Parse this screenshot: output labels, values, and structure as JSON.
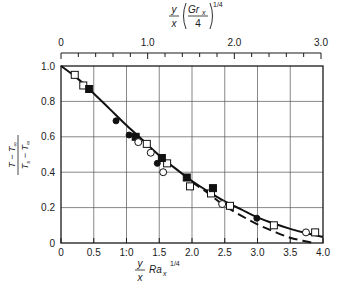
{
  "chart_data": {
    "type": "scatter",
    "title": "",
    "xlabel": "y/x Ra_x^(1/4)",
    "xlabel_parts": {
      "frac_num": "y",
      "frac_den": "x",
      "main": "Ra",
      "sub": "x",
      "sup": "1/4"
    },
    "top_xlabel": "y/x (Gr_x/4)^(1/4)",
    "top_xlabel_parts": {
      "frac_num": "y",
      "frac_den": "x",
      "inner_num": "Gr",
      "inner_sub": "x",
      "inner_den": "4",
      "sup": "1/4"
    },
    "ylabel": "(T − T∞)/(Ts − T∞)",
    "ylabel_parts": {
      "num": "T − T",
      "num_sub": "∞",
      "den": "T",
      "den_sub1": "s",
      "den_mid": " − T",
      "den_sub2": "∞"
    },
    "xlim": [
      0,
      4.0
    ],
    "ylim": [
      0,
      1.0
    ],
    "top_xlim": [
      0,
      3.0
    ],
    "grid": true,
    "x_ticks": [
      0,
      0.5,
      1.0,
      1.5,
      2.0,
      2.5,
      3.0,
      3.5,
      4.0
    ],
    "x_tick_labels": [
      "0",
      "0.5",
      "1:0",
      "1.5",
      "2.0",
      "2.5",
      "3.0",
      "3.5",
      "4.0"
    ],
    "y_ticks": [
      0,
      0.2,
      0.4,
      0.6,
      0.8,
      1.0
    ],
    "y_tick_labels": [
      "0",
      "0.2",
      "0.4",
      "0.6",
      "0.8",
      "1.0"
    ],
    "top_x_major_ticks": [
      0,
      1.0,
      2.0,
      3.0
    ],
    "top_x_tick_labels": [
      "0",
      "1.0",
      "2.0",
      "3.0"
    ],
    "top_x_minor_step": 0.2,
    "legend": null,
    "series": [
      {
        "name": "open squares",
        "marker": "open-square",
        "points": [
          [
            0.21,
            0.95
          ],
          [
            0.34,
            0.89
          ],
          [
            1.31,
            0.56
          ],
          [
            1.62,
            0.45
          ],
          [
            1.97,
            0.32
          ],
          [
            2.29,
            0.28
          ],
          [
            2.58,
            0.21
          ],
          [
            3.25,
            0.1
          ],
          [
            3.88,
            0.06
          ]
        ]
      },
      {
        "name": "filled squares",
        "marker": "filled-square",
        "points": [
          [
            0.43,
            0.87
          ],
          [
            1.14,
            0.6
          ],
          [
            1.54,
            0.48
          ],
          [
            1.92,
            0.37
          ],
          [
            2.32,
            0.31
          ]
        ]
      },
      {
        "name": "open circles",
        "marker": "open-circle",
        "points": [
          [
            1.18,
            0.57
          ],
          [
            1.37,
            0.51
          ],
          [
            1.56,
            0.4
          ],
          [
            2.46,
            0.22
          ],
          [
            3.74,
            0.06
          ]
        ]
      },
      {
        "name": "filled circles",
        "marker": "filled-circle",
        "points": [
          [
            0.84,
            0.69
          ],
          [
            1.04,
            0.61
          ],
          [
            1.47,
            0.45
          ],
          [
            2.99,
            0.14
          ]
        ]
      }
    ],
    "curves": [
      {
        "name": "solid curve",
        "style": "solid",
        "points": [
          [
            0,
            1.0
          ],
          [
            0.25,
            0.93
          ],
          [
            0.5,
            0.845
          ],
          [
            0.75,
            0.755
          ],
          [
            1.0,
            0.665
          ],
          [
            1.25,
            0.58
          ],
          [
            1.5,
            0.495
          ],
          [
            1.75,
            0.42
          ],
          [
            2.0,
            0.35
          ],
          [
            2.25,
            0.29
          ],
          [
            2.5,
            0.235
          ],
          [
            2.75,
            0.19
          ],
          [
            3.0,
            0.145
          ],
          [
            3.25,
            0.11
          ],
          [
            3.5,
            0.08
          ],
          [
            3.75,
            0.055
          ],
          [
            4.0,
            0.035
          ]
        ]
      },
      {
        "name": "dashed curve",
        "style": "dashed",
        "points": [
          [
            2.0,
            0.345
          ],
          [
            2.25,
            0.28
          ],
          [
            2.5,
            0.21
          ],
          [
            2.75,
            0.155
          ],
          [
            3.0,
            0.105
          ],
          [
            3.25,
            0.065
          ],
          [
            3.5,
            0.03
          ],
          [
            3.75,
            0.008
          ],
          [
            3.85,
            0.0
          ]
        ]
      }
    ]
  }
}
